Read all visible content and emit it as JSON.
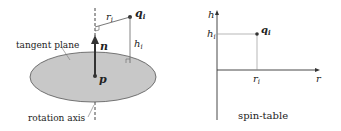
{
  "left": {
    "labels": {
      "tangent": "tangent plane",
      "axis": "rotation axis",
      "n": "n",
      "p": "p",
      "q": "q",
      "q_sub": "i",
      "r": "r",
      "r_sub": "i",
      "h": "h",
      "h_sub": "i"
    }
  },
  "right": {
    "labels": {
      "y_axis": "h",
      "x_axis": "r",
      "h_tick": "h",
      "h_tick_sub": "i",
      "r_tick": "r",
      "r_tick_sub": "i",
      "q": "q",
      "q_sub": "i",
      "caption": "spin-table"
    }
  },
  "colors": {
    "plane_fill": "#c8c8c8",
    "stroke": "#333333"
  }
}
